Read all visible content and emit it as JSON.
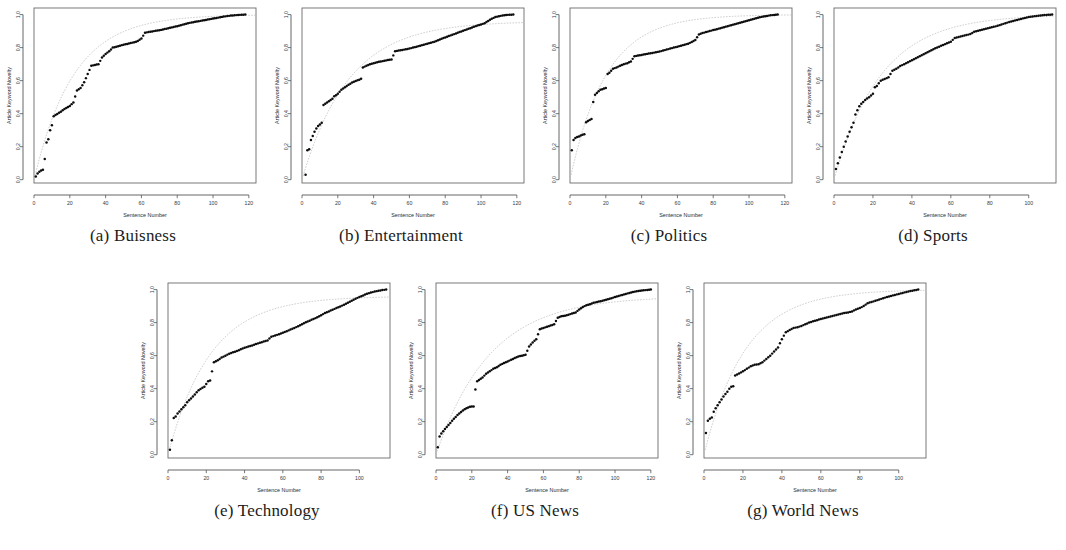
{
  "figure": {
    "caption_prefixes": [
      "(a)",
      "(b)",
      "(c)",
      "(d)",
      "(e)",
      "(f)",
      "(g)"
    ],
    "axis_label_x": "Sentence Number",
    "axis_label_y": "Article Keyword Novelty",
    "dot_color": "#0d0d0d",
    "fit_color": "#b9b9b9",
    "frame_color": "#6a6a6a",
    "background": "#ffffff"
  },
  "panels": [
    {
      "id": "a",
      "letter": "(a)",
      "name": "Buisness",
      "caption": "(a) Buisness"
    },
    {
      "id": "b",
      "letter": "(b)",
      "name": "Entertainment",
      "caption": "(b) Entertainment"
    },
    {
      "id": "c",
      "letter": "(c)",
      "name": "Politics",
      "caption": "(c) Politics"
    },
    {
      "id": "d",
      "letter": "(d)",
      "name": "Sports",
      "caption": "(d) Sports"
    },
    {
      "id": "e",
      "letter": "(e)",
      "name": "Technology",
      "caption": "(e) Technology"
    },
    {
      "id": "f",
      "letter": "(f)",
      "name": "US News",
      "caption": "(f) US News"
    },
    {
      "id": "g",
      "letter": "(g)",
      "name": "World News",
      "caption": "(g) World News"
    }
  ],
  "chart_data": [
    {
      "panel": "a",
      "type": "scatter",
      "title": "Buisness",
      "xlabel": "Sentence Number",
      "ylabel": "Article Keyword Novelty",
      "xlim": [
        0,
        124
      ],
      "ylim": [
        -0.02,
        1.04
      ],
      "xticks": [
        0,
        20,
        40,
        60,
        80,
        100,
        120
      ],
      "yticks": [
        0.0,
        0.2,
        0.4,
        0.6,
        0.8,
        1.0
      ],
      "grid": false,
      "legend": "none",
      "x": [
        1,
        2,
        3,
        4,
        5,
        6,
        7,
        8,
        9,
        10,
        11,
        12,
        13,
        14,
        15,
        16,
        17,
        18,
        19,
        20,
        22,
        24,
        26,
        28,
        30,
        32,
        34,
        36,
        38,
        40,
        42,
        44,
        46,
        48,
        50,
        52,
        54,
        56,
        58,
        60,
        62,
        64,
        66,
        68,
        70,
        72,
        74,
        76,
        78,
        80,
        82,
        84,
        86,
        88,
        90,
        92,
        94,
        96,
        98,
        100,
        102,
        104,
        106,
        108,
        110,
        112,
        114,
        116,
        118
      ],
      "y": [
        0.02,
        0.038,
        0.048,
        0.055,
        0.06,
        0.125,
        0.225,
        0.245,
        0.3,
        0.33,
        0.385,
        0.392,
        0.398,
        0.405,
        0.412,
        0.42,
        0.428,
        0.435,
        0.44,
        0.447,
        0.468,
        0.54,
        0.555,
        0.59,
        0.64,
        0.69,
        0.695,
        0.7,
        0.74,
        0.762,
        0.778,
        0.8,
        0.805,
        0.812,
        0.818,
        0.822,
        0.828,
        0.832,
        0.84,
        0.855,
        0.89,
        0.895,
        0.898,
        0.902,
        0.905,
        0.91,
        0.915,
        0.92,
        0.925,
        0.93,
        0.936,
        0.942,
        0.948,
        0.952,
        0.956,
        0.96,
        0.964,
        0.968,
        0.972,
        0.976,
        0.98,
        0.984,
        0.988,
        0.991,
        0.994,
        0.996,
        0.998,
        0.999,
        1.0
      ],
      "fit": {
        "type": "saturating",
        "asymptote": 1.0,
        "scale": 22
      }
    },
    {
      "panel": "b",
      "type": "scatter",
      "title": "Entertainment",
      "xlabel": "Sentence Number",
      "ylabel": "Article Keyword Novelty",
      "xlim": [
        0,
        124
      ],
      "ylim": [
        -0.02,
        1.04
      ],
      "xticks": [
        0,
        20,
        40,
        60,
        80,
        100,
        120
      ],
      "yticks": [
        0.0,
        0.2,
        0.4,
        0.6,
        0.8,
        1.0
      ],
      "grid": false,
      "legend": "none",
      "x": [
        2,
        3,
        4,
        5,
        6,
        7,
        8,
        9,
        10,
        11,
        12,
        13,
        14,
        15,
        16,
        17,
        18,
        19,
        20,
        22,
        24,
        26,
        28,
        30,
        32,
        33,
        34,
        36,
        38,
        40,
        42,
        44,
        46,
        48,
        50,
        52,
        54,
        56,
        58,
        60,
        62,
        64,
        66,
        68,
        70,
        72,
        74,
        76,
        78,
        80,
        82,
        84,
        86,
        88,
        90,
        92,
        94,
        96,
        98,
        100,
        102,
        104,
        106,
        108,
        110,
        112,
        114,
        116,
        118
      ],
      "y": [
        0.03,
        0.178,
        0.185,
        0.24,
        0.265,
        0.29,
        0.31,
        0.325,
        0.335,
        0.345,
        0.452,
        0.46,
        0.468,
        0.475,
        0.482,
        0.49,
        0.505,
        0.512,
        0.52,
        0.545,
        0.56,
        0.575,
        0.588,
        0.598,
        0.606,
        0.612,
        0.68,
        0.69,
        0.7,
        0.705,
        0.712,
        0.716,
        0.72,
        0.725,
        0.728,
        0.778,
        0.782,
        0.786,
        0.79,
        0.794,
        0.8,
        0.806,
        0.812,
        0.818,
        0.824,
        0.83,
        0.836,
        0.845,
        0.854,
        0.862,
        0.87,
        0.878,
        0.886,
        0.894,
        0.902,
        0.91,
        0.918,
        0.926,
        0.934,
        0.94,
        0.948,
        0.962,
        0.975,
        0.985,
        0.99,
        0.995,
        0.998,
        0.999,
        1.0
      ],
      "fit": {
        "type": "saturating",
        "asymptote": 0.96,
        "scale": 26
      }
    },
    {
      "panel": "c",
      "type": "scatter",
      "title": "Politics",
      "xlabel": "Sentence Number",
      "ylabel": "Article Keyword Novelty",
      "xlim": [
        0,
        124
      ],
      "ylim": [
        -0.02,
        1.04
      ],
      "xticks": [
        0,
        20,
        40,
        60,
        80,
        100,
        120
      ],
      "yticks": [
        0.0,
        0.2,
        0.4,
        0.6,
        0.8,
        1.0
      ],
      "grid": false,
      "legend": "none",
      "x": [
        1,
        2,
        3,
        4,
        5,
        6,
        7,
        8,
        9,
        10,
        11,
        12,
        13,
        14,
        15,
        16,
        17,
        18,
        19,
        20,
        21,
        22,
        24,
        26,
        28,
        30,
        32,
        34,
        36,
        38,
        40,
        42,
        44,
        46,
        48,
        50,
        52,
        54,
        56,
        58,
        60,
        62,
        64,
        66,
        68,
        70,
        72,
        74,
        76,
        78,
        80,
        82,
        84,
        86,
        88,
        90,
        92,
        94,
        96,
        98,
        100,
        102,
        104,
        106,
        108,
        110,
        112,
        114,
        116
      ],
      "y": [
        0.178,
        0.24,
        0.252,
        0.258,
        0.262,
        0.268,
        0.272,
        0.276,
        0.348,
        0.355,
        0.362,
        0.368,
        0.47,
        0.515,
        0.525,
        0.535,
        0.545,
        0.548,
        0.552,
        0.556,
        0.64,
        0.648,
        0.672,
        0.68,
        0.69,
        0.7,
        0.706,
        0.716,
        0.748,
        0.752,
        0.756,
        0.76,
        0.764,
        0.768,
        0.772,
        0.776,
        0.782,
        0.788,
        0.794,
        0.8,
        0.806,
        0.812,
        0.818,
        0.824,
        0.834,
        0.846,
        0.88,
        0.888,
        0.894,
        0.9,
        0.906,
        0.912,
        0.918,
        0.924,
        0.93,
        0.936,
        0.942,
        0.948,
        0.954,
        0.96,
        0.966,
        0.972,
        0.978,
        0.984,
        0.988,
        0.992,
        0.996,
        0.998,
        1.0
      ],
      "fit": {
        "type": "saturating",
        "asymptote": 1.0,
        "scale": 20
      }
    },
    {
      "panel": "d",
      "type": "scatter",
      "title": "Sports",
      "xlabel": "Sentence Number",
      "ylabel": "Article Keyword Novelty",
      "xlim": [
        0,
        114
      ],
      "ylim": [
        -0.02,
        1.04
      ],
      "xticks": [
        0,
        20,
        40,
        60,
        80,
        100
      ],
      "yticks": [
        0.0,
        0.2,
        0.4,
        0.6,
        0.8,
        1.0
      ],
      "grid": false,
      "legend": "none",
      "x": [
        1,
        2,
        3,
        4,
        5,
        6,
        7,
        8,
        9,
        10,
        11,
        12,
        13,
        14,
        15,
        16,
        17,
        18,
        19,
        20,
        21,
        22,
        24,
        26,
        28,
        30,
        32,
        34,
        36,
        38,
        40,
        42,
        44,
        46,
        48,
        50,
        52,
        54,
        56,
        58,
        60,
        62,
        64,
        66,
        68,
        70,
        72,
        74,
        76,
        78,
        80,
        82,
        84,
        86,
        88,
        90,
        92,
        94,
        96,
        98,
        100,
        102,
        104,
        106,
        108,
        110,
        112
      ],
      "y": [
        0.065,
        0.1,
        0.135,
        0.168,
        0.2,
        0.232,
        0.262,
        0.29,
        0.318,
        0.345,
        0.395,
        0.42,
        0.445,
        0.46,
        0.47,
        0.482,
        0.492,
        0.5,
        0.51,
        0.52,
        0.56,
        0.568,
        0.6,
        0.61,
        0.62,
        0.66,
        0.672,
        0.688,
        0.7,
        0.712,
        0.724,
        0.736,
        0.748,
        0.76,
        0.772,
        0.784,
        0.796,
        0.806,
        0.816,
        0.826,
        0.836,
        0.858,
        0.864,
        0.87,
        0.876,
        0.882,
        0.896,
        0.902,
        0.908,
        0.914,
        0.92,
        0.926,
        0.932,
        0.94,
        0.948,
        0.955,
        0.962,
        0.968,
        0.974,
        0.98,
        0.985,
        0.989,
        0.992,
        0.995,
        0.997,
        0.999,
        1.0
      ],
      "fit": {
        "type": "saturating",
        "asymptote": 1.0,
        "scale": 24
      }
    },
    {
      "panel": "e",
      "type": "scatter",
      "title": "Technology",
      "xlabel": "Sentence Number",
      "ylabel": "Article Keyword Novelty",
      "xlim": [
        0,
        116
      ],
      "ylim": [
        -0.02,
        1.04
      ],
      "xticks": [
        0,
        20,
        40,
        60,
        80,
        100
      ],
      "yticks": [
        0.0,
        0.2,
        0.4,
        0.6,
        0.8,
        1.0
      ],
      "grid": false,
      "legend": "none",
      "x": [
        1,
        2,
        3,
        4,
        5,
        6,
        7,
        8,
        9,
        10,
        11,
        12,
        13,
        14,
        15,
        16,
        17,
        18,
        19,
        20,
        21,
        22,
        24,
        26,
        28,
        30,
        32,
        34,
        36,
        38,
        40,
        42,
        44,
        46,
        48,
        50,
        52,
        54,
        56,
        58,
        60,
        62,
        64,
        66,
        68,
        70,
        72,
        74,
        76,
        78,
        80,
        82,
        84,
        86,
        88,
        90,
        92,
        94,
        96,
        98,
        100,
        102,
        104,
        106,
        108,
        110,
        112,
        114
      ],
      "y": [
        0.03,
        0.088,
        0.222,
        0.232,
        0.25,
        0.262,
        0.275,
        0.288,
        0.3,
        0.318,
        0.33,
        0.34,
        0.352,
        0.365,
        0.378,
        0.39,
        0.398,
        0.405,
        0.412,
        0.428,
        0.445,
        0.45,
        0.56,
        0.572,
        0.588,
        0.6,
        0.612,
        0.62,
        0.628,
        0.638,
        0.648,
        0.655,
        0.662,
        0.67,
        0.678,
        0.685,
        0.692,
        0.715,
        0.722,
        0.73,
        0.738,
        0.748,
        0.758,
        0.768,
        0.778,
        0.79,
        0.802,
        0.812,
        0.822,
        0.832,
        0.845,
        0.858,
        0.868,
        0.878,
        0.888,
        0.898,
        0.908,
        0.92,
        0.932,
        0.945,
        0.955,
        0.965,
        0.975,
        0.982,
        0.988,
        0.993,
        0.997,
        1.0
      ],
      "fit": {
        "type": "saturating",
        "asymptote": 0.96,
        "scale": 22
      }
    },
    {
      "panel": "f",
      "type": "scatter",
      "title": "US News",
      "xlabel": "Sentence Number",
      "ylabel": "Article Keyword Novelty",
      "xlim": [
        0,
        124
      ],
      "ylim": [
        -0.02,
        1.04
      ],
      "xticks": [
        0,
        20,
        40,
        60,
        80,
        100,
        120
      ],
      "yticks": [
        0.0,
        0.2,
        0.4,
        0.6,
        0.8,
        1.0
      ],
      "grid": false,
      "legend": "none",
      "x": [
        1,
        2,
        3,
        4,
        5,
        6,
        7,
        8,
        9,
        10,
        11,
        12,
        13,
        14,
        15,
        16,
        17,
        18,
        19,
        20,
        21,
        22,
        23,
        24,
        25,
        26,
        28,
        30,
        32,
        34,
        36,
        38,
        40,
        42,
        44,
        46,
        48,
        50,
        52,
        54,
        56,
        58,
        60,
        62,
        64,
        66,
        68,
        70,
        72,
        74,
        76,
        78,
        80,
        82,
        84,
        86,
        88,
        90,
        92,
        94,
        96,
        98,
        100,
        102,
        104,
        106,
        108,
        110,
        112,
        114,
        116,
        118,
        120
      ],
      "y": [
        0.045,
        0.11,
        0.128,
        0.142,
        0.155,
        0.168,
        0.18,
        0.192,
        0.205,
        0.218,
        0.228,
        0.24,
        0.25,
        0.258,
        0.268,
        0.276,
        0.282,
        0.286,
        0.29,
        0.292,
        0.292,
        0.395,
        0.445,
        0.452,
        0.46,
        0.468,
        0.49,
        0.505,
        0.52,
        0.53,
        0.545,
        0.555,
        0.565,
        0.575,
        0.585,
        0.595,
        0.6,
        0.605,
        0.655,
        0.68,
        0.7,
        0.76,
        0.768,
        0.775,
        0.782,
        0.79,
        0.83,
        0.838,
        0.842,
        0.848,
        0.855,
        0.862,
        0.88,
        0.895,
        0.905,
        0.912,
        0.92,
        0.925,
        0.93,
        0.935,
        0.942,
        0.948,
        0.955,
        0.962,
        0.968,
        0.974,
        0.98,
        0.985,
        0.99,
        0.993,
        0.996,
        0.998,
        1.0
      ],
      "fit": {
        "type": "saturating",
        "asymptote": 0.96,
        "scale": 30
      }
    },
    {
      "panel": "g",
      "type": "scatter",
      "title": "World News",
      "xlabel": "Sentence Number",
      "ylabel": "Article Keyword Novelty",
      "xlim": [
        0,
        114
      ],
      "ylim": [
        -0.02,
        1.04
      ],
      "xticks": [
        0,
        20,
        40,
        60,
        80,
        100
      ],
      "yticks": [
        0.0,
        0.2,
        0.4,
        0.6,
        0.8,
        1.0
      ],
      "grid": false,
      "legend": "none",
      "x": [
        1,
        2,
        3,
        4,
        5,
        6,
        7,
        8,
        9,
        10,
        11,
        12,
        13,
        14,
        15,
        16,
        18,
        20,
        22,
        24,
        26,
        28,
        30,
        32,
        34,
        36,
        38,
        40,
        42,
        44,
        46,
        48,
        50,
        52,
        54,
        56,
        58,
        60,
        62,
        64,
        66,
        68,
        70,
        72,
        74,
        76,
        78,
        80,
        82,
        84,
        86,
        88,
        90,
        92,
        94,
        96,
        98,
        100,
        102,
        104,
        106,
        108,
        110
      ],
      "y": [
        0.132,
        0.205,
        0.218,
        0.225,
        0.26,
        0.282,
        0.3,
        0.318,
        0.335,
        0.352,
        0.368,
        0.382,
        0.4,
        0.412,
        0.415,
        0.48,
        0.492,
        0.505,
        0.52,
        0.535,
        0.545,
        0.548,
        0.56,
        0.58,
        0.6,
        0.625,
        0.65,
        0.7,
        0.742,
        0.755,
        0.768,
        0.772,
        0.78,
        0.79,
        0.8,
        0.808,
        0.815,
        0.822,
        0.828,
        0.834,
        0.84,
        0.846,
        0.852,
        0.858,
        0.862,
        0.868,
        0.88,
        0.888,
        0.9,
        0.918,
        0.925,
        0.932,
        0.94,
        0.948,
        0.955,
        0.962,
        0.968,
        0.974,
        0.98,
        0.986,
        0.991,
        0.996,
        1.0
      ],
      "fit": {
        "type": "saturating",
        "asymptote": 1.0,
        "scale": 21
      }
    }
  ]
}
